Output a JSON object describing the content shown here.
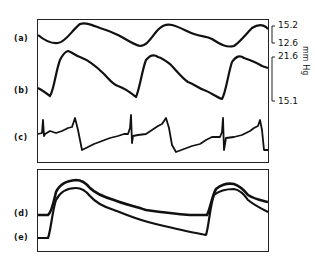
{
  "figure": {
    "panels": [
      {
        "id": "top",
        "traces": [
          "(a)",
          "(b)",
          "(c)"
        ]
      },
      {
        "id": "bottom",
        "traces": [
          "(d)",
          "(e)"
        ]
      }
    ],
    "labels": {
      "a": "(a)",
      "b": "(b)",
      "c": "(c)",
      "d": "(d)",
      "e": "(e)"
    },
    "scale": {
      "a_top": "15.2",
      "a_bottom": "12.6",
      "b_top": "21.6",
      "b_bottom": "15.1",
      "unit": "mm Hg"
    }
  }
}
